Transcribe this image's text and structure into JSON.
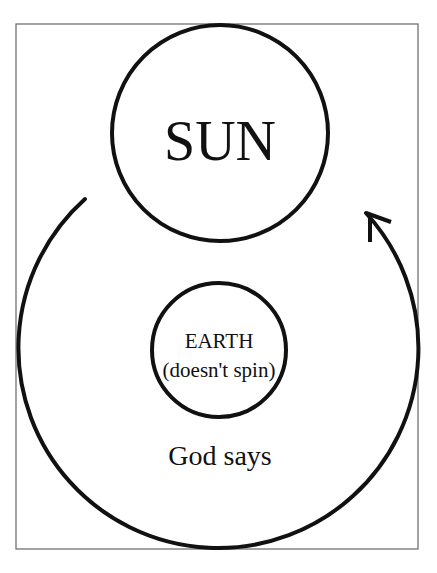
{
  "diagram": {
    "sun": {
      "label": "SUN"
    },
    "earth": {
      "label": "EARTH",
      "sublabel": "(doesn't spin)"
    },
    "caption": "God says",
    "orbit": {
      "direction": "clockwise",
      "arrow": "arrowhead-at-upper-right"
    }
  },
  "colors": {
    "stroke": "#111111",
    "frame": "#666666",
    "background": "#ffffff"
  }
}
